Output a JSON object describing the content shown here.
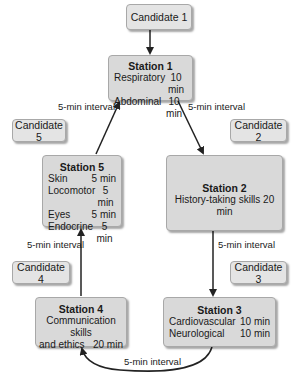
{
  "candidates": [
    "Candidate 1",
    "Candidate 2",
    "Candidate 3",
    "Candidate 4",
    "Candidate 5"
  ],
  "stations": {
    "s1": {
      "title": "Station 1",
      "rows": [
        {
          "name": "Respiratory",
          "time": "10 min"
        },
        {
          "name": "Abdominal",
          "time": "10 min"
        }
      ]
    },
    "s2": {
      "title": "Station 2",
      "text": "History-taking skills 20 min"
    },
    "s3": {
      "title": "Station 3",
      "rows": [
        {
          "name": "Cardiovascular",
          "time": "10 min"
        },
        {
          "name": "Neurological",
          "time": "10 min"
        }
      ]
    },
    "s4": {
      "title": "Station 4",
      "line1": "Communication skills",
      "line2": "and ethics   20 min"
    },
    "s5": {
      "title": "Station 5",
      "rows": [
        {
          "name": "Skin",
          "time": "5 min"
        },
        {
          "name": "Locomotor",
          "time": "5 min"
        },
        {
          "name": "Eyes",
          "time": "5 min"
        },
        {
          "name": "Endocrine",
          "time": "5 min"
        }
      ]
    }
  },
  "interval_label": "5-min interval",
  "intervals": [
    "5-min interval",
    "5-min interval",
    "5-min interval",
    "5-min interval",
    "5-min interval"
  ]
}
